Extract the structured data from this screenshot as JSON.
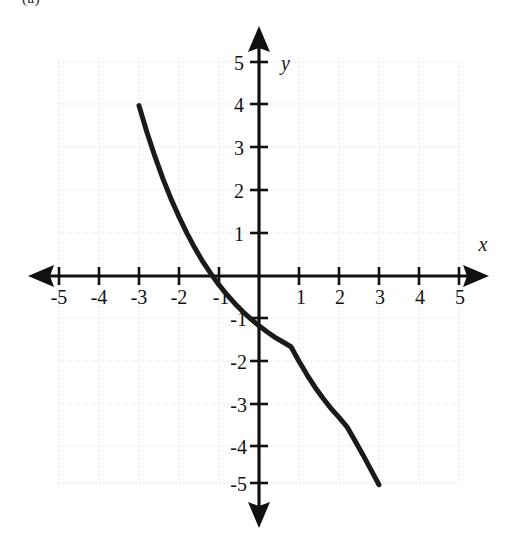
{
  "figure": {
    "corner_label": "(a)",
    "background_color": "#ffffff",
    "curve_color": "#1a1a1a",
    "axis_color": "#111111",
    "grid_color": "#d8d8dc"
  },
  "chart_data": {
    "type": "line",
    "title": "",
    "subtitle": "",
    "xlabel": "x",
    "ylabel": "y",
    "xlim": [
      -5,
      5
    ],
    "ylim": [
      -5,
      5
    ],
    "grid": true,
    "grid_step": 1,
    "legend": "none",
    "annotations": [],
    "axis_arrows": [
      "left",
      "right",
      "up",
      "down"
    ],
    "xticks": [
      -5,
      -4,
      -3,
      -2,
      -1,
      1,
      2,
      3,
      4,
      5
    ],
    "xtick_labels": [
      "-5",
      "-4",
      "-3",
      "-2",
      "-1",
      "1",
      "2",
      "3",
      "4",
      "5"
    ],
    "yticks": [
      5,
      4,
      3,
      2,
      1,
      -1,
      -2,
      -3,
      -4,
      -5
    ],
    "ytick_labels": [
      "5",
      "4",
      "3",
      "2",
      "1",
      "-1",
      "-2",
      "-3",
      "-4",
      "-5"
    ],
    "series": [
      {
        "name": "decaying exponential",
        "style": "solid",
        "width": 5,
        "x_domain": [
          -3,
          3
        ],
        "x": [
          -3.0,
          -2.8,
          -2.6,
          -2.4,
          -2.2,
          -2.0,
          -1.8,
          -1.6,
          -1.4,
          -1.2,
          -1.0,
          -0.8,
          -0.6,
          -0.4,
          -0.2,
          0.0,
          0.2,
          0.4,
          0.6,
          0.8,
          1.0,
          1.2,
          1.4,
          1.6,
          1.8,
          2.0,
          2.2,
          2.4,
          2.6,
          2.8,
          3.0
        ],
        "y": [
          4.0,
          3.37,
          2.8,
          2.28,
          1.81,
          1.39,
          1.0,
          0.65,
          0.33,
          0.05,
          -0.21,
          -0.44,
          -0.65,
          -0.84,
          -1.01,
          -1.17,
          -1.31,
          -1.44,
          -1.55,
          -1.66,
          -2.0,
          -2.32,
          -2.61,
          -2.87,
          -3.11,
          -3.32,
          -3.54,
          -3.87,
          -4.2,
          -4.55,
          -4.9
        ]
      }
    ],
    "key_points": {
      "left_endpoint": [
        -3,
        4
      ],
      "x_intercept": [
        -1.4,
        0
      ],
      "y_intercept": [
        0,
        -2.6
      ],
      "right_endpoint": [
        3,
        -4.9
      ],
      "horizontal_asymptote": -5
    }
  }
}
